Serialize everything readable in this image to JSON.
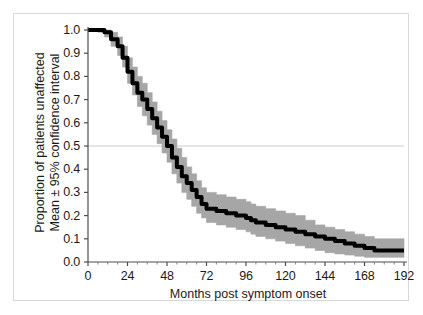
{
  "figure": {
    "background": "#ffffff",
    "border_color": "#d9d9d9"
  },
  "chart_data": {
    "type": "line",
    "title": "",
    "subtitle": "",
    "xlabel": "Months post symptom onset",
    "ylabel_line1": "Proportion of patients unaffected",
    "ylabel_line2": "Mean ± 95% confidence interval",
    "xlim": [
      0,
      192
    ],
    "ylim": [
      0.0,
      1.0
    ],
    "xticks": [
      0,
      24,
      48,
      72,
      96,
      120,
      144,
      168,
      192
    ],
    "xtick_labels": [
      "0",
      "24",
      "48",
      "72",
      "96",
      "120",
      "144",
      "168",
      "192"
    ],
    "yticks": [
      0.0,
      0.1,
      0.2,
      0.3,
      0.4,
      0.5,
      0.6,
      0.7,
      0.8,
      0.9,
      1.0
    ],
    "ytick_labels": [
      "0.0",
      "0.1",
      "0.2",
      "0.3",
      "0.4",
      "0.5",
      "0.6",
      "0.7",
      "0.8",
      "0.9",
      "1.0"
    ],
    "grid": "horizontal-single-at-0.5",
    "gridline_y": 0.5,
    "gridline_color": "#cccccc",
    "legend": "none",
    "line_color": "#000000",
    "band_color": "#a6a6a6",
    "band_label": "95% confidence interval",
    "series": [
      {
        "name": "Mean proportion unaffected",
        "x": [
          0,
          6,
          10,
          14,
          18,
          21,
          24,
          27,
          30,
          33,
          36,
          39,
          42,
          45,
          48,
          51,
          54,
          57,
          60,
          63,
          66,
          69,
          72,
          78,
          84,
          90,
          96,
          99,
          102,
          108,
          114,
          120,
          126,
          132,
          138,
          144,
          150,
          156,
          162,
          168,
          174,
          180,
          186,
          192
        ],
        "values": [
          1.0,
          1.0,
          0.99,
          0.96,
          0.93,
          0.88,
          0.82,
          0.77,
          0.73,
          0.7,
          0.66,
          0.62,
          0.58,
          0.54,
          0.5,
          0.45,
          0.41,
          0.37,
          0.34,
          0.31,
          0.28,
          0.25,
          0.23,
          0.22,
          0.21,
          0.2,
          0.19,
          0.18,
          0.17,
          0.16,
          0.15,
          0.14,
          0.13,
          0.12,
          0.11,
          0.1,
          0.09,
          0.08,
          0.07,
          0.06,
          0.05,
          0.05,
          0.05,
          0.05
        ]
      }
    ],
    "ci_upper": {
      "name": "Upper 95% confidence limit",
      "x": [
        0,
        6,
        10,
        14,
        18,
        21,
        24,
        27,
        30,
        33,
        36,
        39,
        42,
        45,
        48,
        51,
        54,
        57,
        60,
        63,
        66,
        69,
        72,
        78,
        84,
        90,
        96,
        99,
        102,
        108,
        114,
        120,
        126,
        132,
        138,
        144,
        150,
        156,
        162,
        168,
        174,
        180,
        186,
        192
      ],
      "values": [
        1.0,
        1.0,
        1.0,
        0.99,
        0.97,
        0.93,
        0.88,
        0.84,
        0.8,
        0.77,
        0.73,
        0.69,
        0.65,
        0.61,
        0.57,
        0.53,
        0.49,
        0.45,
        0.41,
        0.38,
        0.35,
        0.32,
        0.3,
        0.29,
        0.28,
        0.27,
        0.26,
        0.25,
        0.24,
        0.23,
        0.22,
        0.21,
        0.2,
        0.18,
        0.16,
        0.15,
        0.14,
        0.13,
        0.12,
        0.11,
        0.1,
        0.1,
        0.1,
        0.1
      ]
    },
    "ci_lower": {
      "name": "Lower 95% confidence limit",
      "x": [
        0,
        6,
        10,
        14,
        18,
        21,
        24,
        27,
        30,
        33,
        36,
        39,
        42,
        45,
        48,
        51,
        54,
        57,
        60,
        63,
        66,
        69,
        72,
        78,
        84,
        90,
        96,
        99,
        102,
        108,
        114,
        120,
        126,
        132,
        138,
        144,
        150,
        156,
        162,
        168,
        174,
        180,
        186,
        192
      ],
      "values": [
        1.0,
        0.99,
        0.97,
        0.93,
        0.89,
        0.84,
        0.77,
        0.72,
        0.67,
        0.63,
        0.59,
        0.55,
        0.51,
        0.47,
        0.43,
        0.38,
        0.34,
        0.3,
        0.27,
        0.24,
        0.21,
        0.19,
        0.17,
        0.16,
        0.15,
        0.14,
        0.13,
        0.12,
        0.11,
        0.1,
        0.09,
        0.08,
        0.07,
        0.06,
        0.05,
        0.04,
        0.035,
        0.03,
        0.025,
        0.02,
        0.02,
        0.02,
        0.02,
        0.02
      ]
    }
  }
}
